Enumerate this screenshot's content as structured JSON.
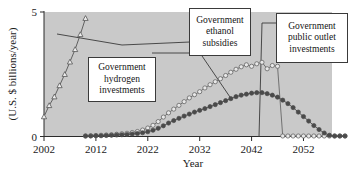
{
  "chart_data": {
    "type": "line",
    "title": "",
    "xlabel": "Year",
    "ylabel": "(U.S. $ billions/year)",
    "xlim": [
      2002,
      2060
    ],
    "ylim": [
      0,
      5
    ],
    "xticks": [
      2002,
      2012,
      2022,
      2032,
      2042,
      2052
    ],
    "yticks": [
      0,
      5
    ],
    "ytick_labels": [
      "0",
      "5"
    ],
    "grid": false,
    "legend": "none",
    "plot_background": "#c9c9c9",
    "series": [
      {
        "name": "Government hydrogen investments",
        "marker": "open-triangle",
        "color": "#555555",
        "x": [
          2002,
          2003,
          2004,
          2005,
          2006,
          2007,
          2008,
          2009,
          2010
        ],
        "values": [
          0.8,
          1.25,
          1.6,
          2.05,
          2.5,
          3.0,
          3.5,
          4.1,
          4.75
        ]
      },
      {
        "name": "Government public outlet investments",
        "marker": "open-circle",
        "color": "#666666",
        "x": [
          2010,
          2011,
          2012,
          2013,
          2014,
          2015,
          2016,
          2017,
          2018,
          2019,
          2020,
          2021,
          2022,
          2023,
          2024,
          2025,
          2026,
          2027,
          2028,
          2029,
          2030,
          2031,
          2032,
          2033,
          2034,
          2035,
          2036,
          2037,
          2038,
          2039,
          2040,
          2041,
          2042,
          2043,
          2044,
          2045,
          2046,
          2047,
          2048,
          2049,
          2050,
          2051,
          2052,
          2053,
          2054,
          2055,
          2056,
          2057,
          2058,
          2059,
          2060
        ],
        "values": [
          0.02,
          0.03,
          0.04,
          0.05,
          0.06,
          0.07,
          0.09,
          0.11,
          0.13,
          0.16,
          0.2,
          0.26,
          0.34,
          0.45,
          0.6,
          0.78,
          0.95,
          1.1,
          1.25,
          1.4,
          1.55,
          1.68,
          1.8,
          1.95,
          2.08,
          2.2,
          2.32,
          2.45,
          2.58,
          2.7,
          2.8,
          2.88,
          2.82,
          2.92,
          2.98,
          2.72,
          2.85,
          2.82,
          0.02,
          0.02,
          0.02,
          0.02,
          0.02,
          0.02,
          0.02,
          0.02,
          0.02,
          0.02,
          0.02,
          0.02,
          0.02
        ]
      },
      {
        "name": "Government ethanol subsidies",
        "marker": "filled-circle",
        "color": "#4a4a4a",
        "x": [
          2010,
          2011,
          2012,
          2013,
          2014,
          2015,
          2016,
          2017,
          2018,
          2019,
          2020,
          2021,
          2022,
          2023,
          2024,
          2025,
          2026,
          2027,
          2028,
          2029,
          2030,
          2031,
          2032,
          2033,
          2034,
          2035,
          2036,
          2037,
          2038,
          2039,
          2040,
          2041,
          2042,
          2043,
          2044,
          2045,
          2046,
          2047,
          2048,
          2049,
          2050,
          2051,
          2052,
          2053,
          2054,
          2055,
          2056,
          2057,
          2058,
          2059,
          2060
        ],
        "values": [
          0.02,
          0.02,
          0.03,
          0.03,
          0.04,
          0.05,
          0.06,
          0.07,
          0.08,
          0.1,
          0.12,
          0.15,
          0.19,
          0.25,
          0.33,
          0.43,
          0.54,
          0.64,
          0.73,
          0.82,
          0.9,
          0.98,
          1.05,
          1.12,
          1.2,
          1.28,
          1.36,
          1.44,
          1.52,
          1.6,
          1.66,
          1.7,
          1.74,
          1.76,
          1.76,
          1.72,
          1.66,
          1.58,
          1.46,
          1.32,
          1.16,
          0.98,
          0.8,
          0.62,
          0.44,
          0.28,
          0.14,
          0.05,
          0.02,
          0.02,
          0.02
        ]
      }
    ],
    "annotations": [
      {
        "id": "hydrogen",
        "lines": [
          "Government",
          "hydrogen",
          "investments"
        ]
      },
      {
        "id": "ethanol",
        "lines": [
          "Government",
          "ethanol",
          "subsidies"
        ]
      },
      {
        "id": "public-outlet",
        "lines": [
          "Government",
          "public outlet",
          "investments"
        ]
      }
    ]
  }
}
